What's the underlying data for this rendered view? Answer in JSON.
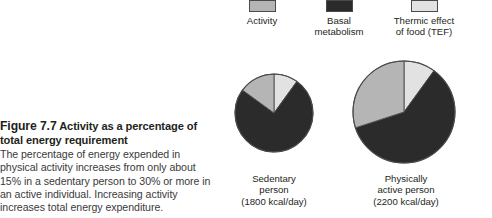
{
  "figure": {
    "number_label": "Figure 7.7",
    "heading_rest": "Activity as a percentage of total energy requirement",
    "body": "The percentage of energy expended in physical activity increases from only about 15% in a sedentary person to 30% or more in an active individual. Increasing activity increases total energy expenditure."
  },
  "legend": {
    "items": [
      {
        "label": "Activity",
        "color": "#b5b5b5",
        "icon": "legend-swatch-icon"
      },
      {
        "label": "Basal\nmetabolism",
        "color": "#2b2b2b",
        "icon": "legend-swatch-icon"
      },
      {
        "label": "Thermic effect\nof food (TEF)",
        "color": "#e2e2e2",
        "icon": "legend-swatch-icon"
      }
    ]
  },
  "pies": [
    {
      "id": "sedentary",
      "caption": "Sedentary\nperson\n(1800 kcal/day)",
      "name": "Sedentary person",
      "energy_kcal_per_day": 1800,
      "center_x": 274,
      "center_y": 113,
      "radius": 39
    },
    {
      "id": "active",
      "caption": "Physically\nactive person\n(2200 kcal/day)",
      "name": "Physically active person",
      "energy_kcal_per_day": 2200,
      "center_x": 404,
      "center_y": 112,
      "radius": 51
    }
  ],
  "chart_data": {
    "type": "pie",
    "title": "Activity as a percentage of total energy requirement",
    "legend_position": "top",
    "stroke": "#4a4a4a",
    "charts": [
      {
        "name": "Sedentary person (1800 kcal/day)",
        "categories": [
          "Thermic effect of food (TEF)",
          "Basal metabolism",
          "Activity"
        ],
        "values": [
          10,
          75,
          15
        ],
        "colors": [
          "#e2e2e2",
          "#2b2b2b",
          "#b5b5b5"
        ],
        "start_angle_deg": -90
      },
      {
        "name": "Physically active person (2200 kcal/day)",
        "categories": [
          "Thermic effect of food (TEF)",
          "Basal metabolism",
          "Activity"
        ],
        "values": [
          10,
          60,
          30
        ],
        "colors": [
          "#e2e2e2",
          "#2b2b2b",
          "#b5b5b5"
        ],
        "start_angle_deg": -90
      }
    ]
  }
}
